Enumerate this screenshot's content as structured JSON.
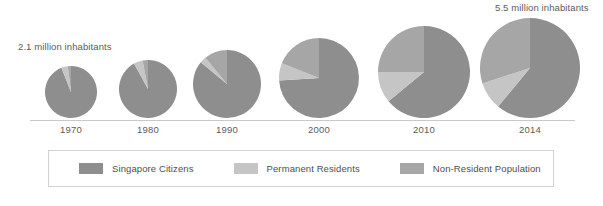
{
  "annotations": {
    "left": "2.1 million inhabitants",
    "right": "5.5 million inhabitants"
  },
  "legend": {
    "items": [
      {
        "label": "Singapore Citizens",
        "color": "#8e8e8e",
        "key": "citizens"
      },
      {
        "label": "Permanent Residents",
        "color": "#c5c5c5",
        "key": "permanent_residents"
      },
      {
        "label": "Non-Resident Population",
        "color": "#a6a6a6",
        "key": "non_residents"
      }
    ]
  },
  "chart_data": {
    "type": "pie",
    "title": "",
    "subtitle": "",
    "xlabel": "",
    "ylabel": "",
    "grid": false,
    "legend_position": "bottom",
    "note": "Series of proportional pie charts; pie radius scales with total population.",
    "categories": [
      "1970",
      "1980",
      "1990",
      "2000",
      "2010",
      "2014"
    ],
    "slice_labels": [
      "Singapore Citizens",
      "Permanent Residents",
      "Non-Resident Population"
    ],
    "slice_colors": [
      "#8e8e8e",
      "#c5c5c5",
      "#a6a6a6"
    ],
    "totals_millions": [
      2.1,
      2.4,
      3.0,
      4.0,
      5.1,
      5.5
    ],
    "total_units": "million inhabitants",
    "series": [
      {
        "name": "Singapore Citizens",
        "values": [
          94,
          92,
          86,
          74,
          64,
          61
        ]
      },
      {
        "name": "Permanent Residents",
        "values": [
          4,
          5,
          3,
          7,
          11,
          9
        ]
      },
      {
        "name": "Non-Resident Population",
        "values": [
          2,
          3,
          11,
          19,
          25,
          30
        ]
      }
    ],
    "value_unit": "percent",
    "pies": [
      {
        "year": "1970",
        "total_millions": 2.1,
        "radius_px": 26,
        "cx": 71,
        "cy": 92,
        "slices": [
          {
            "label": "Singapore Citizens",
            "percent": 94,
            "color": "#8e8e8e"
          },
          {
            "label": "Permanent Residents",
            "percent": 4,
            "color": "#c5c5c5"
          },
          {
            "label": "Non-Resident Population",
            "percent": 2,
            "color": "#a6a6a6"
          }
        ]
      },
      {
        "year": "1980",
        "total_millions": 2.4,
        "radius_px": 29,
        "cx": 148,
        "cy": 89,
        "slices": [
          {
            "label": "Singapore Citizens",
            "percent": 92,
            "color": "#8e8e8e"
          },
          {
            "label": "Permanent Residents",
            "percent": 5,
            "color": "#c5c5c5"
          },
          {
            "label": "Non-Resident Population",
            "percent": 3,
            "color": "#a6a6a6"
          }
        ]
      },
      {
        "year": "1990",
        "total_millions": 3.0,
        "radius_px": 34,
        "cx": 227,
        "cy": 84,
        "slices": [
          {
            "label": "Singapore Citizens",
            "percent": 86,
            "color": "#8e8e8e"
          },
          {
            "label": "Permanent Residents",
            "percent": 3,
            "color": "#c5c5c5"
          },
          {
            "label": "Non-Resident Population",
            "percent": 11,
            "color": "#a6a6a6"
          }
        ]
      },
      {
        "year": "2000",
        "total_millions": 4.0,
        "radius_px": 40,
        "cx": 319,
        "cy": 78,
        "slices": [
          {
            "label": "Singapore Citizens",
            "percent": 74,
            "color": "#8e8e8e"
          },
          {
            "label": "Permanent Residents",
            "percent": 7,
            "color": "#c5c5c5"
          },
          {
            "label": "Non-Resident Population",
            "percent": 19,
            "color": "#a6a6a6"
          }
        ]
      },
      {
        "year": "2010",
        "total_millions": 5.1,
        "radius_px": 46,
        "cx": 424,
        "cy": 72,
        "slices": [
          {
            "label": "Singapore Citizens",
            "percent": 64,
            "color": "#8e8e8e"
          },
          {
            "label": "Permanent Residents",
            "percent": 11,
            "color": "#c5c5c5"
          },
          {
            "label": "Non-Resident Population",
            "percent": 25,
            "color": "#a6a6a6"
          }
        ]
      },
      {
        "year": "2014",
        "total_millions": 5.5,
        "radius_px": 50,
        "cx": 530,
        "cy": 68,
        "slices": [
          {
            "label": "Singapore Citizens",
            "percent": 61,
            "color": "#8e8e8e"
          },
          {
            "label": "Permanent Residents",
            "percent": 9,
            "color": "#c5c5c5"
          },
          {
            "label": "Non-Resident Population",
            "percent": 30,
            "color": "#a6a6a6"
          }
        ]
      }
    ]
  }
}
